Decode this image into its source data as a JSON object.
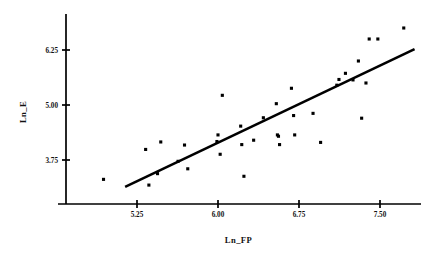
{
  "chart_data": {
    "type": "scatter",
    "title": "",
    "xlabel": "Ln_FP",
    "ylabel": "Ln_E",
    "xticks": [
      5.25,
      6.0,
      6.75,
      7.5
    ],
    "xtick_labels": [
      "5.25",
      "6.00",
      "6.75",
      "7.50"
    ],
    "yticks": [
      3.75,
      5.0,
      6.25
    ],
    "ytick_labels": [
      "3.75",
      "5.00",
      "6.25"
    ],
    "xlim": [
      4.9,
      7.85
    ],
    "ylim": [
      2.9,
      6.95
    ],
    "grid": false,
    "legend": null,
    "marker": "square",
    "marker_color": "#000000",
    "line_color": "#000000",
    "points": [
      {
        "x": 4.94,
        "y": 3.31
      },
      {
        "x": 5.33,
        "y": 3.99
      },
      {
        "x": 5.36,
        "y": 3.18
      },
      {
        "x": 5.44,
        "y": 3.44
      },
      {
        "x": 5.47,
        "y": 4.16
      },
      {
        "x": 5.63,
        "y": 3.72
      },
      {
        "x": 5.69,
        "y": 4.09
      },
      {
        "x": 5.72,
        "y": 3.55
      },
      {
        "x": 5.99,
        "y": 4.17
      },
      {
        "x": 6.0,
        "y": 4.32
      },
      {
        "x": 6.02,
        "y": 3.88
      },
      {
        "x": 6.04,
        "y": 5.22
      },
      {
        "x": 6.21,
        "y": 4.52
      },
      {
        "x": 6.22,
        "y": 4.1
      },
      {
        "x": 6.24,
        "y": 3.38
      },
      {
        "x": 6.33,
        "y": 4.2
      },
      {
        "x": 6.42,
        "y": 4.71
      },
      {
        "x": 6.54,
        "y": 5.03
      },
      {
        "x": 6.55,
        "y": 4.32
      },
      {
        "x": 6.56,
        "y": 4.29
      },
      {
        "x": 6.57,
        "y": 4.1
      },
      {
        "x": 6.68,
        "y": 5.38
      },
      {
        "x": 6.7,
        "y": 4.76
      },
      {
        "x": 6.71,
        "y": 4.32
      },
      {
        "x": 6.88,
        "y": 4.81
      },
      {
        "x": 6.95,
        "y": 4.15
      },
      {
        "x": 7.1,
        "y": 5.45
      },
      {
        "x": 7.12,
        "y": 5.58
      },
      {
        "x": 7.18,
        "y": 5.72
      },
      {
        "x": 7.25,
        "y": 5.57
      },
      {
        "x": 7.3,
        "y": 6.0
      },
      {
        "x": 7.33,
        "y": 4.7
      },
      {
        "x": 7.37,
        "y": 5.5
      },
      {
        "x": 7.4,
        "y": 6.5
      },
      {
        "x": 7.48,
        "y": 6.5
      },
      {
        "x": 7.72,
        "y": 6.75
      }
    ],
    "fit_line": {
      "x0": 5.14,
      "y0": 3.14,
      "x1": 7.82,
      "y1": 6.27
    }
  }
}
